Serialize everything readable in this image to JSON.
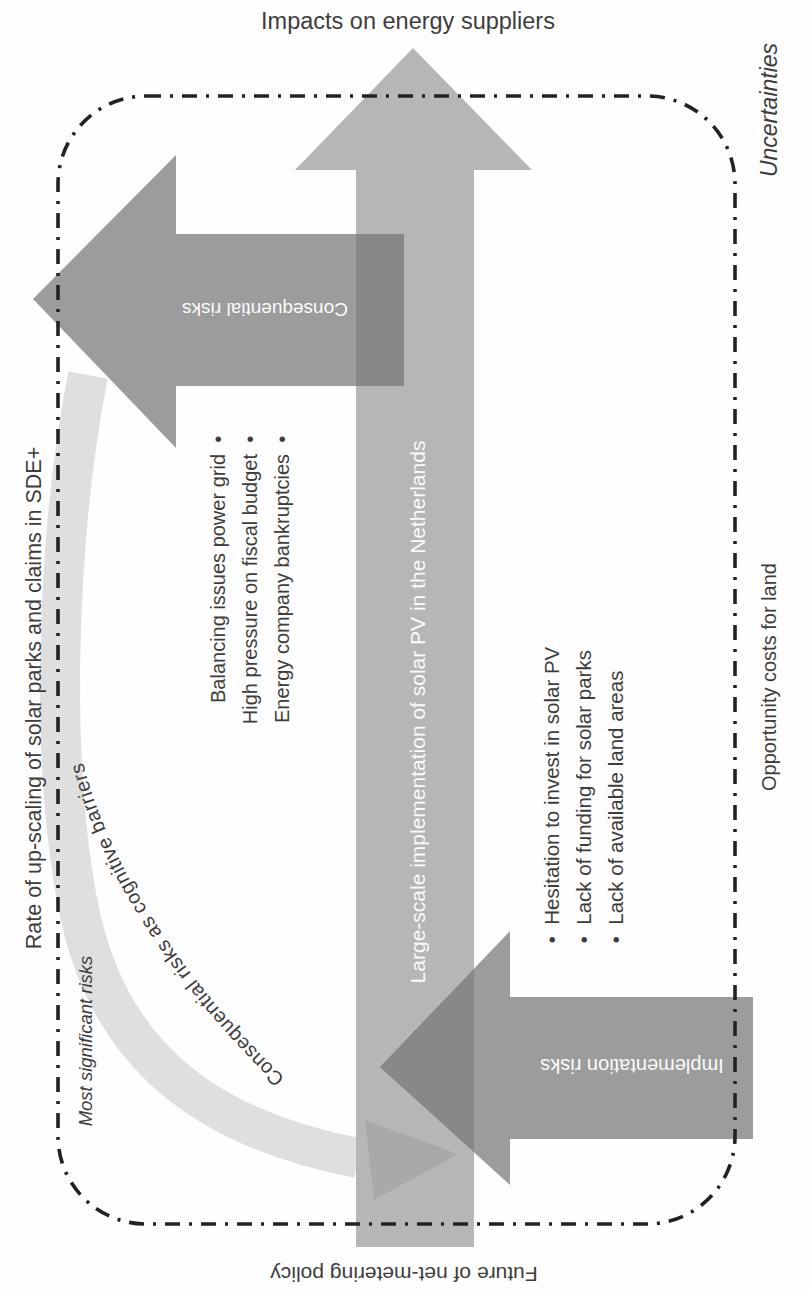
{
  "figure": {
    "title_top": "Impacts on energy suppliers",
    "corner_note_top_right": "Uncertainties",
    "left_note": "Rate of up-scaling of solar parks and claims in SDE+",
    "left_note_bottom": "Most significant risks",
    "right_note": "Opportunity costs for land",
    "bottom_note": "Future of net-metering policy",
    "central_arrow_label": "Large-scale implementation of solar PV in the Netherlands",
    "consequential_arrow_label": "Consequential risks",
    "implementation_arrow_label": "Implementation risks",
    "curved_arrow_label": "Consequential risks as cognitive barriers",
    "consequential_items": [
      "Balancing issues power grid",
      "High pressure on fiscal budget",
      "Energy company bankruptcies"
    ],
    "implementation_items": [
      "Hesitation to invest in solar PV",
      "Lack of funding for solar parks",
      "Lack of available land areas"
    ],
    "colors": {
      "central_arrow": "#b6b6b6",
      "risk_arrow": "#9c9c9c",
      "overlap": "#888888",
      "curved_band": "#dfdfdf",
      "curved_arrowhead": "#a9a9a9",
      "border": "#222222",
      "text": "#3d3d3d",
      "text_on_arrow": "#fafafa"
    }
  }
}
